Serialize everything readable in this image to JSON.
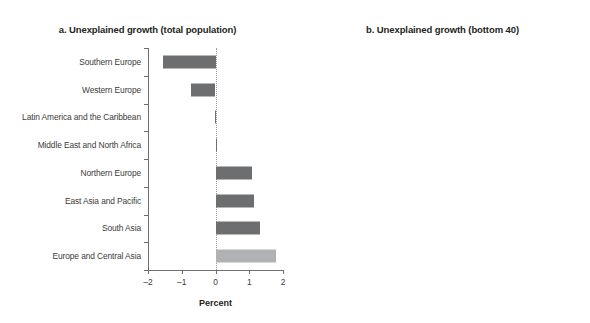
{
  "figure": {
    "background_color": "#ffffff",
    "bar_color_primary": "#6d6e70",
    "bar_color_highlight": "#b0b1b3",
    "axis_color": "#6f6f6f",
    "text_color": "#231f20"
  },
  "panels": [
    {
      "id": "panel-a",
      "title": "a. Unexplained growth (total population)",
      "axis_title": "Percent",
      "xlim": [
        -2,
        2
      ],
      "xticks": [
        -2,
        -1,
        0,
        1,
        2
      ],
      "xticklabels": [
        "–2",
        "–1",
        "0",
        "1",
        "2"
      ],
      "categories": [
        "Southern Europe",
        "Western Europe",
        "Latin America and the Caribbean",
        "Middle East and North Africa",
        "Northern Europe",
        "East Asia and Pacific",
        "South Asia",
        "Europe and Central Asia"
      ],
      "values": [
        -1.55,
        -0.72,
        -0.02,
        0.03,
        1.08,
        1.15,
        1.33,
        1.8
      ],
      "highlight_index": 7
    },
    {
      "id": "panel-b",
      "title": "b. Unexplained growth (bottom 40)",
      "axis_title": "Percent",
      "xlim": [
        -3,
        2
      ],
      "xticks": [
        -3,
        -2,
        -1,
        0,
        1,
        2
      ],
      "xticklabels": [
        "–3",
        "–2",
        "–1",
        "0",
        "1",
        "2"
      ],
      "categories": [
        "Southern Europe",
        "Western Europe",
        "Middle East and North Africa",
        "East Asia and Pacific",
        "South Asia",
        "Northern Europe",
        "Europe and Central Asia",
        "Latin America and the Caribbean"
      ],
      "values": [
        -1.85,
        0.1,
        0.2,
        0.32,
        0.55,
        0.95,
        1.4,
        1.7
      ],
      "highlight_index": 6
    }
  ],
  "chart_data": {
    "type": "bar",
    "orientation": "horizontal",
    "grid": false,
    "legend": "none",
    "panels": [
      {
        "label": "a. Unexplained growth (total population)",
        "xlabel": "Percent",
        "ylabel": "",
        "xlim": [
          -2,
          2
        ],
        "xticks": [
          -2,
          -1,
          0,
          1,
          2
        ],
        "categories": [
          "Southern Europe",
          "Western Europe",
          "Latin America and the Caribbean",
          "Middle East and North Africa",
          "Northern Europe",
          "East Asia and Pacific",
          "South Asia",
          "Europe and Central Asia"
        ],
        "values": [
          -1.55,
          -0.72,
          -0.02,
          0.03,
          1.08,
          1.15,
          1.33,
          1.8
        ]
      },
      {
        "label": "b. Unexplained growth (bottom 40)",
        "xlabel": "Percent",
        "ylabel": "",
        "xlim": [
          -3,
          2
        ],
        "xticks": [
          -3,
          -2,
          -1,
          0,
          1,
          2
        ],
        "categories": [
          "Southern Europe",
          "Western Europe",
          "Middle East and North Africa",
          "East Asia and Pacific",
          "South Asia",
          "Northern Europe",
          "Europe and Central Asia",
          "Latin America and the Caribbean"
        ],
        "values": [
          -1.85,
          0.1,
          0.2,
          0.32,
          0.55,
          0.95,
          1.4,
          1.7
        ]
      }
    ]
  }
}
